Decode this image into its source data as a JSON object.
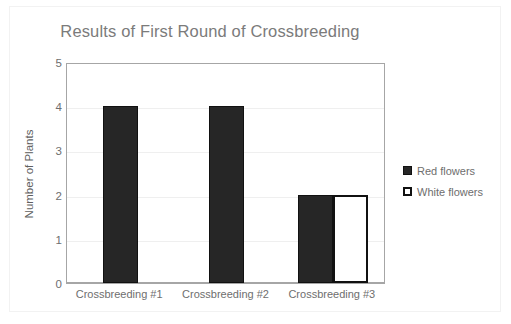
{
  "chart_data": {
    "type": "bar",
    "title": "Results of First Round of Crossbreeding",
    "xlabel": "",
    "ylabel": "Number of Plants",
    "categories": [
      "Crossbreeding #1",
      "Crossbreeding #2",
      "Crossbreeding #3"
    ],
    "series": [
      {
        "name": "Red flowers",
        "values": [
          4,
          4,
          2
        ],
        "color": "#262626"
      },
      {
        "name": "White flowers",
        "values": [
          0,
          0,
          2
        ],
        "color": "#ffffff"
      }
    ],
    "ylim": [
      0,
      5
    ],
    "yticks": [
      0,
      1,
      2,
      3,
      4,
      5
    ],
    "ytick_labels": [
      "0",
      "1",
      "2",
      "3",
      "4",
      "5"
    ],
    "grid": true,
    "legend_position": "right",
    "bar_mode": "grouped"
  },
  "legend": {
    "entries": [
      {
        "label": "Red flowers",
        "swatch": "filled-dark-square-icon"
      },
      {
        "label": "White flowers",
        "swatch": "outlined-white-square-icon"
      }
    ]
  },
  "colors": {
    "title": "#7b7b7b",
    "tick_text": "#6e6e6e",
    "axis_line": "#a6a6a6",
    "gridline": "#efefef",
    "bar_dark": "#262626",
    "bar_white": "#ffffff",
    "bar_outline": "#111111",
    "background": "#ffffff"
  }
}
